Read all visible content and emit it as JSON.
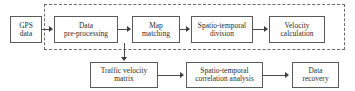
{
  "figure": {
    "type": "flowchart",
    "orientation": "left-to-right, two rows",
    "background_color": "#ffffff",
    "line_color": "#4a4a4a",
    "text_color": "#2b2b2b",
    "dashed_group_color": "#6b6b6b"
  },
  "nodes": {
    "gps_data": "GPS\ndata",
    "data_preprocessing": "Data\npre-processing",
    "map_matching": "Map\nmatching",
    "spatio_temporal_division": "Spatio-temporal\ndivision",
    "velocity_calculation": "Velocity\ncalculation",
    "traffic_velocity_matrix": "Traffic velocity\nmatrix",
    "spatio_temporal_correlation_analysis": "Spatio-temporal\ncorrelation analysis",
    "data_recovery": "Data\nrecovery"
  },
  "groups": {
    "dashed_group_label": ""
  },
  "edges": [
    {
      "from": "gps_data",
      "to": "data_preprocessing",
      "style": "solid-arrow"
    },
    {
      "from": "data_preprocessing",
      "to": "map_matching",
      "style": "solid-arrow"
    },
    {
      "from": "map_matching",
      "to": "spatio_temporal_division",
      "style": "solid-arrow"
    },
    {
      "from": "spatio_temporal_division",
      "to": "velocity_calculation",
      "style": "solid-arrow"
    },
    {
      "from": "data_preprocessing_row",
      "to": "traffic_velocity_matrix",
      "style": "solid-arrow-down"
    },
    {
      "from": "traffic_velocity_matrix",
      "to": "spatio_temporal_correlation_analysis",
      "style": "solid-arrow"
    },
    {
      "from": "spatio_temporal_correlation_analysis",
      "to": "data_recovery",
      "style": "solid-arrow"
    }
  ]
}
